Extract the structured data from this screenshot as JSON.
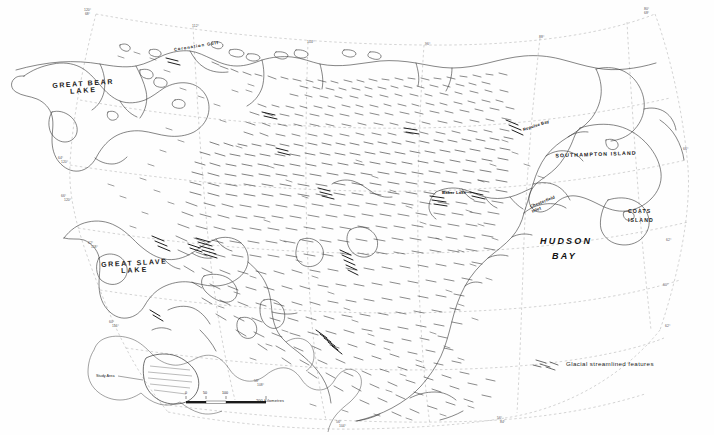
{
  "map": {
    "title": "Glacial streamlined features of the Keewatin region",
    "projection_note": "",
    "background_color": "#ffffff",
    "line_color": "#333333",
    "graticule_color": "#999999",
    "feature_color": "#222222"
  },
  "water_labels": [
    {
      "name": "great-bear-lake",
      "text": "GREAT BEAR\nLAKE",
      "line1": "GREAT BEAR",
      "line2": "LAKE",
      "x": 52,
      "y": 86
    },
    {
      "name": "great-slave-lake",
      "text": "GREAT SLAVE\nLAKE",
      "line1": "GREAT SLAVE",
      "line2": "LAKE",
      "x": 103,
      "y": 265
    }
  ],
  "hudson_bay": {
    "line1": "HUDSON",
    "line2": "BAY",
    "x": 548,
    "y": 243
  },
  "island_labels": [
    {
      "name": "southampton-island",
      "label": "SOUTHAMPTON ISLAND",
      "x": 597,
      "y": 153
    },
    {
      "name": "coats-island",
      "line1": "COATS",
      "line2": "ISLAND",
      "x": 632,
      "y": 212
    }
  ],
  "place_labels": [
    {
      "name": "coronation-gulf",
      "label": "Coronation Gulf",
      "x": 175,
      "y": 46,
      "rotate": -9
    },
    {
      "name": "repulse-bay",
      "label": "Repulse Bay",
      "x": 523,
      "y": 126,
      "rotate": -17
    },
    {
      "name": "baker-lake",
      "label": "Baker Lake",
      "x": 443,
      "y": 193,
      "rotate": 0
    },
    {
      "name": "chesterfield-inlet",
      "line1": "Chesterfield",
      "line2": "Inlet",
      "x": 533,
      "y": 206,
      "rotate": -22
    }
  ],
  "graticule_labels": [
    {
      "name": "grat-120-68",
      "line1": "120°",
      "line2": "68°",
      "x": 88,
      "y": 9
    },
    {
      "name": "grat-112",
      "line1": "112°",
      "line2": "",
      "x": 194,
      "y": 24
    },
    {
      "name": "grat-104-top",
      "line1": "104°",
      "line2": "",
      "x": 309,
      "y": 40
    },
    {
      "name": "grat-96-top",
      "line1": "96°",
      "line2": "",
      "x": 427,
      "y": 42
    },
    {
      "name": "grat-88-top",
      "line1": "88°",
      "line2": "",
      "x": 541,
      "y": 35
    },
    {
      "name": "grat-80-68",
      "line1": "80°",
      "line2": "68°",
      "x": 648,
      "y": 8
    },
    {
      "name": "grat-64-left",
      "line1": "64°",
      "line2": "120°",
      "x": 60,
      "y": 158
    },
    {
      "name": "grat-66-left",
      "line1": "66°",
      "line2": "120°",
      "x": 63,
      "y": 196
    },
    {
      "name": "grat-62-left",
      "line1": "62°",
      "line2": "118°",
      "x": 90,
      "y": 243
    },
    {
      "name": "grat-60-left",
      "line1": "60°",
      "line2": "116°",
      "x": 111,
      "y": 322
    },
    {
      "name": "grat-58-bot",
      "line1": "58°",
      "line2": "108°",
      "x": 256,
      "y": 381
    },
    {
      "name": "grat-56-bot",
      "line1": "56°",
      "line2": "104°",
      "x": 338,
      "y": 422
    },
    {
      "name": "grat-56-right-bot",
      "line1": "56°",
      "line2": "84°",
      "x": 499,
      "y": 418
    },
    {
      "name": "grat-62-right",
      "line1": "62°",
      "line2": "",
      "x": 668,
      "y": 240
    },
    {
      "name": "grat-66-right",
      "line1": "66°",
      "line2": "",
      "x": 685,
      "y": 148
    },
    {
      "name": "grat-62-hb",
      "line1": "62°",
      "line2": "",
      "x": 667,
      "y": 325
    },
    {
      "name": "grat-60-hb",
      "line1": "60°",
      "line2": "",
      "x": 665,
      "y": 284
    },
    {
      "name": "grat-64-hb",
      "line1": "64°",
      "line2": "",
      "x": 666,
      "y": 243
    }
  ],
  "legend": {
    "name": "legend",
    "label": "Glacial streamlined features",
    "symbol": "streamlined-lines",
    "x": 566,
    "y": 364
  },
  "scale_bar": {
    "ticks": [
      "0",
      "50",
      "100"
    ],
    "unit_label": "200 Kilometres",
    "x": 186,
    "y": 399
  },
  "inset": {
    "name": "north-america-inset",
    "study_area_label": "Study Area",
    "x": 96,
    "y": 340
  }
}
